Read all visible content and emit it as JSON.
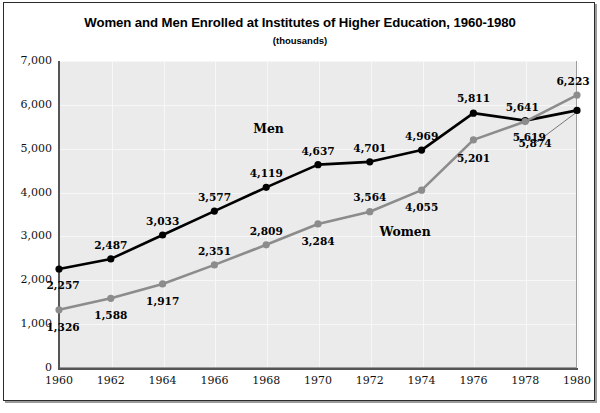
{
  "chart_data": {
    "type": "line",
    "title": "Women and Men Enrolled at Institutes of Higher Education, 1960-1980",
    "subtitle": "(thousands)",
    "xlabel": "",
    "ylabel": "",
    "units": "thousands",
    "grid": true,
    "legend_position": "inline-annotation",
    "xlim": [
      1960,
      1980
    ],
    "ylim": [
      0,
      7000
    ],
    "x": [
      1960,
      1962,
      1964,
      1966,
      1968,
      1970,
      1972,
      1974,
      1976,
      1978,
      1980
    ],
    "categories": [
      "1960",
      "1962",
      "1964",
      "1966",
      "1968",
      "1970",
      "1972",
      "1974",
      "1976",
      "1978",
      "1980"
    ],
    "xticks": [
      "1960",
      "1962",
      "1964",
      "1966",
      "1968",
      "1970",
      "1972",
      "1974",
      "1976",
      "1978",
      "1980"
    ],
    "yticks": [
      "0",
      "1,000",
      "2,000",
      "3,000",
      "4,000",
      "5,000",
      "6,000",
      "7,000"
    ],
    "ytick_values": [
      0,
      1000,
      2000,
      3000,
      4000,
      5000,
      6000,
      7000
    ],
    "series": [
      {
        "name": "Men",
        "color": "#000000",
        "marker": "circle",
        "values": [
          2257,
          2487,
          3033,
          3577,
          4119,
          4637,
          4701,
          4969,
          5811,
          5641,
          5874
        ],
        "labels": [
          "2,257",
          "2,487",
          "3,033",
          "3,577",
          "4,119",
          "4,637",
          "4,701",
          "4,969",
          "5,811",
          "5,641",
          "5,874"
        ]
      },
      {
        "name": "Women",
        "color": "#8c8c8c",
        "marker": "circle",
        "values": [
          1326,
          1588,
          1917,
          2351,
          2809,
          3284,
          3564,
          4055,
          5201,
          5619,
          6223
        ],
        "labels": [
          "1,326",
          "1,588",
          "1,917",
          "2,351",
          "2,809",
          "3,284",
          "3,564",
          "4,055",
          "5,201",
          "5,619",
          "6,223"
        ]
      }
    ],
    "annotations": [
      {
        "text": "Men",
        "series": "Men"
      },
      {
        "text": "Women",
        "series": "Women"
      }
    ]
  },
  "footer": {
    "note": ""
  }
}
